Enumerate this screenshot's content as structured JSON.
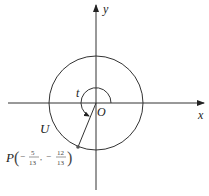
{
  "diagram": {
    "axes": {
      "x_label": "x",
      "y_label": "y",
      "origin_label": "O"
    },
    "circle_label": "U",
    "angle_label": "t",
    "point": {
      "name": "P",
      "x_num": "5",
      "x_den": "13",
      "y_num": "12",
      "y_den": "13",
      "x_sign": "−",
      "y_sign": "−",
      "comma": ","
    },
    "colors": {
      "stroke": "#333333",
      "point": "#555555"
    }
  }
}
